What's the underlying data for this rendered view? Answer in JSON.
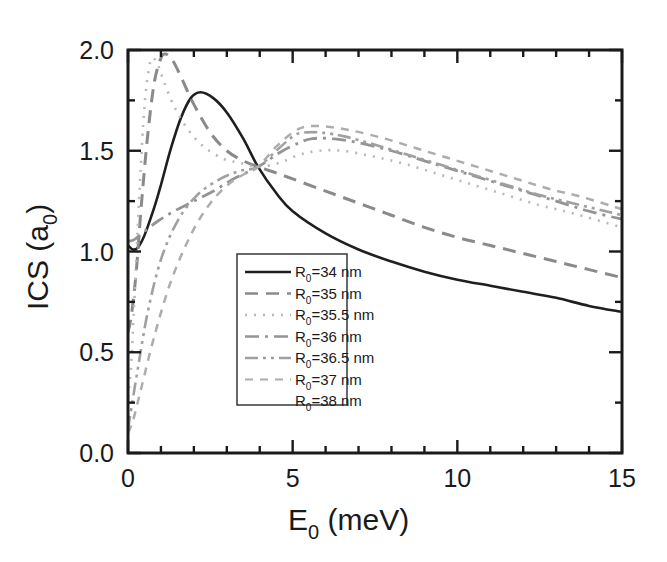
{
  "chart_data": {
    "type": "line",
    "title": "",
    "xlabel": "E_0 (meV)",
    "xlabel_main": "E",
    "xlabel_sub": "0",
    "xlabel_unit": " (meV)",
    "ylabel": "ICS (a_0)",
    "ylabel_main": "ICS (a",
    "ylabel_sub": "0",
    "ylabel_close": ")",
    "xlim": [
      0,
      15
    ],
    "ylim": [
      0.0,
      2.0
    ],
    "xticks": [
      0,
      5,
      10,
      15
    ],
    "xtick_labels": [
      "0",
      "5",
      "10",
      "15"
    ],
    "xminor_step": 1,
    "yticks": [
      0.0,
      0.5,
      1.0,
      1.5,
      2.0
    ],
    "ytick_labels": [
      "0.0",
      "0.5",
      "1.0",
      "1.5",
      "2.0"
    ],
    "yminor_step": 0.25,
    "grid": false,
    "legend_position": "center-left-inside",
    "crossing_point": {
      "x": 3.95,
      "y": 1.42
    },
    "series": [
      {
        "name": "R_0=34 nm",
        "label_prefix": "R",
        "label_sub": "0",
        "label_rest": "=34 nm",
        "style": "solid",
        "color": "#1f1f1f",
        "width": 2.6,
        "dash": "",
        "peak": {
          "x": 2.2,
          "y": 1.79
        },
        "x": [
          0.0,
          0.15,
          0.3,
          0.5,
          0.8,
          1.0,
          1.3,
          1.6,
          1.9,
          2.2,
          2.6,
          3.0,
          3.5,
          3.95,
          4.5,
          5.0,
          6.0,
          7.0,
          8.0,
          9.0,
          10.0,
          11.0,
          12.0,
          13.0,
          14.0,
          15.0
        ],
        "y": [
          1.03,
          1.01,
          1.02,
          1.08,
          1.22,
          1.33,
          1.51,
          1.66,
          1.76,
          1.79,
          1.76,
          1.69,
          1.56,
          1.42,
          1.29,
          1.2,
          1.09,
          1.01,
          0.95,
          0.9,
          0.86,
          0.83,
          0.8,
          0.77,
          0.73,
          0.7
        ]
      },
      {
        "name": "R_0=35 nm",
        "label_prefix": "R",
        "label_sub": "0",
        "label_rest": "=35 nm",
        "style": "dashed",
        "color": "#8a8a8a",
        "width": 3.0,
        "dash": "13 8",
        "peak": {
          "x": 1.15,
          "y": 1.98
        },
        "x": [
          0.0,
          0.1,
          0.25,
          0.4,
          0.6,
          0.8,
          1.0,
          1.15,
          1.35,
          1.6,
          2.0,
          2.5,
          3.0,
          3.5,
          3.95,
          4.5,
          5.0,
          6.0,
          7.0,
          8.0,
          9.0,
          10.0,
          11.0,
          12.0,
          13.0,
          14.0,
          15.0
        ],
        "y": [
          0.6,
          0.68,
          0.9,
          1.22,
          1.58,
          1.84,
          1.96,
          1.98,
          1.95,
          1.87,
          1.73,
          1.59,
          1.5,
          1.45,
          1.42,
          1.39,
          1.36,
          1.3,
          1.24,
          1.18,
          1.12,
          1.07,
          1.03,
          0.99,
          0.95,
          0.91,
          0.87
        ]
      },
      {
        "name": "R_0=35.5 nm",
        "label_prefix": "R",
        "label_sub": "0",
        "label_rest": "=35.5 nm",
        "style": "dotted",
        "color": "#b8b8b8",
        "width": 2.6,
        "dash": "2 7",
        "peak": {
          "x": 0.75,
          "y": 1.96
        },
        "x": [
          0.0,
          0.1,
          0.2,
          0.35,
          0.5,
          0.65,
          0.75,
          0.9,
          1.1,
          1.4,
          1.8,
          2.3,
          2.9,
          3.4,
          3.95,
          4.6,
          5.2,
          5.8,
          6.5,
          7.5,
          8.5,
          9.5,
          10.5,
          11.5,
          12.5,
          13.5,
          15.0
        ],
        "y": [
          0.28,
          0.45,
          0.78,
          1.3,
          1.72,
          1.92,
          1.96,
          1.93,
          1.84,
          1.72,
          1.61,
          1.52,
          1.46,
          1.44,
          1.42,
          1.44,
          1.48,
          1.5,
          1.5,
          1.47,
          1.43,
          1.38,
          1.33,
          1.28,
          1.23,
          1.19,
          1.12
        ]
      },
      {
        "name": "R_0=36 nm",
        "label_prefix": "R",
        "label_sub": "0",
        "label_rest": "=36 nm",
        "style": "dash-dot",
        "color": "#949494",
        "width": 2.8,
        "dash": "14 6 3 6",
        "peak": {
          "x": 5.6,
          "y": 1.56
        },
        "x": [
          0.0,
          0.2,
          0.5,
          0.9,
          1.4,
          2.0,
          2.6,
          3.2,
          3.95,
          4.6,
          5.2,
          5.6,
          6.2,
          7.0,
          8.0,
          9.0,
          10.0,
          11.0,
          12.0,
          13.0,
          14.0,
          15.0
        ],
        "y": [
          1.05,
          1.06,
          1.1,
          1.15,
          1.2,
          1.25,
          1.3,
          1.36,
          1.42,
          1.49,
          1.54,
          1.56,
          1.56,
          1.54,
          1.5,
          1.45,
          1.4,
          1.35,
          1.3,
          1.25,
          1.2,
          1.16
        ]
      },
      {
        "name": "R_0=36.5 nm",
        "label_prefix": "R",
        "label_sub": "0",
        "label_rest": "=36.5 nm",
        "style": "dash-dot-dot",
        "color": "#a0a0a0",
        "width": 2.6,
        "dash": "13 5 3 5 3 5",
        "peak": {
          "x": 5.3,
          "y": 1.59
        },
        "x": [
          0.0,
          0.1,
          0.3,
          0.6,
          1.0,
          1.5,
          2.1,
          2.8,
          3.4,
          3.95,
          4.5,
          5.0,
          5.3,
          5.9,
          6.6,
          7.5,
          8.5,
          9.5,
          10.5,
          11.5,
          12.5,
          13.5,
          15.0
        ],
        "y": [
          0.12,
          0.22,
          0.42,
          0.7,
          0.96,
          1.15,
          1.28,
          1.36,
          1.4,
          1.42,
          1.5,
          1.57,
          1.59,
          1.59,
          1.57,
          1.53,
          1.48,
          1.43,
          1.38,
          1.33,
          1.28,
          1.24,
          1.18
        ]
      },
      {
        "name": "R_0=37 nm",
        "label_prefix": "R",
        "label_sub": "0",
        "label_rest": "=37 nm",
        "style": "short-dash",
        "color": "#adadad",
        "width": 2.5,
        "dash": "8 7",
        "peak": {
          "x": 5.4,
          "y": 1.62
        },
        "x": [
          0.0,
          0.15,
          0.4,
          0.8,
          1.3,
          1.9,
          2.5,
          3.1,
          3.6,
          3.95,
          4.5,
          5.0,
          5.4,
          6.0,
          6.8,
          7.8,
          8.8,
          9.8,
          10.8,
          11.8,
          12.8,
          13.8,
          15.0
        ],
        "y": [
          0.1,
          0.16,
          0.32,
          0.58,
          0.85,
          1.08,
          1.24,
          1.34,
          1.39,
          1.42,
          1.52,
          1.59,
          1.62,
          1.62,
          1.6,
          1.56,
          1.51,
          1.46,
          1.41,
          1.36,
          1.31,
          1.27,
          1.21
        ]
      },
      {
        "name": "R_0=38 nm",
        "label_prefix": "R",
        "label_sub": "0",
        "label_rest": "=38 nm",
        "style": "none",
        "color": "#c4c4c4",
        "width": 0,
        "dash": "",
        "peak": {
          "x": 0,
          "y": 0
        },
        "x": [],
        "y": []
      }
    ]
  },
  "legend": {
    "items": [
      {
        "label_prefix": "R",
        "label_sub": "0",
        "label_rest": "=34 nm",
        "swatch": "solid"
      },
      {
        "label_prefix": "R",
        "label_sub": "0",
        "label_rest": "=35 nm",
        "swatch": "dashed"
      },
      {
        "label_prefix": "R",
        "label_sub": "0",
        "label_rest": "=35.5 nm",
        "swatch": "dotted"
      },
      {
        "label_prefix": "R",
        "label_sub": "0",
        "label_rest": "=36 nm",
        "swatch": "dash-dot"
      },
      {
        "label_prefix": "R",
        "label_sub": "0",
        "label_rest": "=36.5 nm",
        "swatch": "dash-dot-dot"
      },
      {
        "label_prefix": "R",
        "label_sub": "0",
        "label_rest": "=37 nm",
        "swatch": "short-dash"
      },
      {
        "label_prefix": "R",
        "label_sub": "0",
        "label_rest": "=38 nm",
        "swatch": "none"
      }
    ]
  },
  "colors": {
    "axis": "#1a1a1a",
    "background": "#ffffff",
    "curve_primary": "#1f1f1f",
    "curve_grey": "#9a9a9a"
  }
}
